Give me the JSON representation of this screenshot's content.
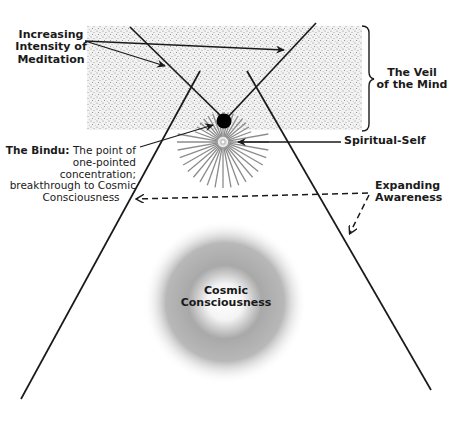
{
  "diagram": {
    "title_cropped": "",
    "labels": {
      "increasing_intensity": [
        "Increasing",
        "Intensity of",
        "Meditation"
      ],
      "veil": [
        "The Veil",
        "of the Mind"
      ],
      "spiritual_self": "Spiritual-Self",
      "bindu_title": "The Bindu:",
      "bindu_desc_1": " The point of",
      "bindu_desc_2": "one-pointed concentration;",
      "bindu_desc_3": "breakthrough to Cosmic",
      "bindu_desc_4": "Consciousness",
      "expanding": [
        "Expanding",
        "Awareness"
      ],
      "cosmic": [
        "Cosmic",
        "Consciousness"
      ]
    },
    "colors": {
      "line": "#1a1a1a",
      "veil_stipple": "#8a8a8a",
      "rays": "#8c8c8c",
      "glow": "#9a9a9a",
      "bindu": "#000000"
    }
  }
}
